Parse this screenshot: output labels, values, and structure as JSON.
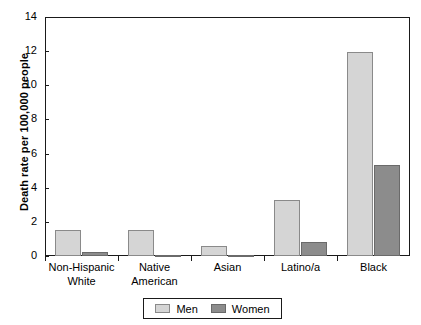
{
  "chart_data": {
    "type": "bar",
    "title": "",
    "subtitle": "",
    "xlabel": "",
    "ylabel": "Death rate per 100,000 people",
    "ylim": [
      0,
      14
    ],
    "ytick_values": [
      0,
      2,
      4,
      6,
      8,
      10,
      12,
      14
    ],
    "ytick_labels": [
      "0",
      "2",
      "4",
      "6",
      "8",
      "10",
      "12",
      "14"
    ],
    "grid": false,
    "legend_position": "bottom-center",
    "categories": [
      "Non-Hispanic White",
      "Native American",
      "Asian",
      "Latino/a",
      "Black"
    ],
    "category_lines": [
      [
        "Non-Hispanic",
        "White"
      ],
      [
        "Native",
        "American"
      ],
      [
        "Asian"
      ],
      [
        "Latino/a"
      ],
      [
        "Black"
      ]
    ],
    "series": [
      {
        "name": "Men",
        "color": "#d5d5d5",
        "values": [
          1.5,
          1.55,
          0.6,
          3.3,
          11.95
        ]
      },
      {
        "name": "Women",
        "color": "#8c8c8c",
        "values": [
          0.25,
          0.05,
          0.05,
          0.8,
          5.35
        ]
      }
    ]
  },
  "legend": {
    "items": [
      {
        "label": "Men",
        "swatch": "men-swatch"
      },
      {
        "label": "Women",
        "swatch": "women-swatch"
      }
    ]
  },
  "axis": {
    "y_title": "Death rate per 100,000 people"
  }
}
